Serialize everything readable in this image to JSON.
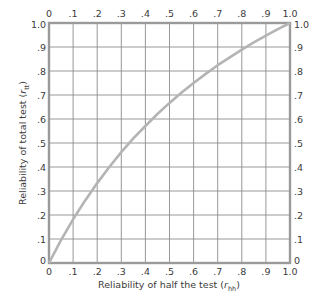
{
  "chart_data": {
    "type": "line",
    "title": "",
    "xlabel": "Reliability of half the test (r_hh)",
    "ylabel": "Reliability of total test (r_tt)",
    "xlabel_main": "Reliability of half the test (",
    "xlabel_sym": "r",
    "xlabel_sub": "hh",
    "xlabel_close": ")",
    "ylabel_main": "Reliability of total test (",
    "ylabel_sym": "r",
    "ylabel_sub": "tt",
    "ylabel_close": ")",
    "xlim": [
      0,
      1.0
    ],
    "ylim": [
      0,
      1.0
    ],
    "grid": true,
    "legend": "none",
    "x_ticks_bottom": [
      "0",
      ".1",
      ".2",
      ".3",
      ".4",
      ".5",
      ".6",
      ".7",
      ".8",
      ".9",
      "1.0"
    ],
    "x_ticks_top": [
      "0",
      ".1",
      ".2",
      ".3",
      ".4",
      ".5",
      ".6",
      ".7",
      ".8",
      ".9",
      "1.0"
    ],
    "y_ticks_left": [
      "0",
      ".1",
      ".2",
      ".3",
      ".4",
      ".5",
      ".6",
      ".7",
      ".8",
      ".9",
      "1.0"
    ],
    "y_ticks_right": [
      "0",
      ".1",
      ".2",
      ".3",
      ".4",
      ".5",
      ".6",
      ".7",
      ".8",
      ".9",
      "1.0"
    ],
    "series": [
      {
        "name": "Spearman-Brown (total test vs half test)",
        "x": [
          0,
          0.05,
          0.1,
          0.15,
          0.2,
          0.25,
          0.3,
          0.35,
          0.4,
          0.45,
          0.5,
          0.55,
          0.6,
          0.65,
          0.7,
          0.75,
          0.8,
          0.85,
          0.9,
          0.95,
          1.0
        ],
        "values": [
          0,
          0.095,
          0.182,
          0.261,
          0.333,
          0.4,
          0.462,
          0.519,
          0.571,
          0.621,
          0.667,
          0.71,
          0.75,
          0.788,
          0.824,
          0.857,
          0.889,
          0.919,
          0.947,
          0.974,
          1.0
        ]
      }
    ],
    "colors": {
      "curve": "#b4b4b4",
      "grid": "#8c8c8c",
      "frame": "#9a9a9a",
      "text": "#3c3c3c"
    }
  }
}
